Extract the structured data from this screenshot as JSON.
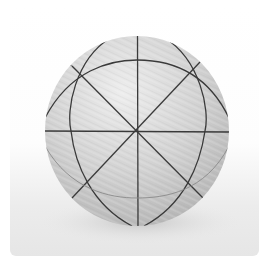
{
  "image": {
    "subject": "temari thread ball",
    "description": "Grey thread-wrapped sphere divided by dark guide lines into segments, on a white background with soft shadow",
    "colors": {
      "background": "#ffffff",
      "ball_fill": "#cfcfcf",
      "ball_highlight": "#ececec",
      "guide_lines": "#3a3a3a",
      "shadow": "#dcdcdc"
    }
  }
}
